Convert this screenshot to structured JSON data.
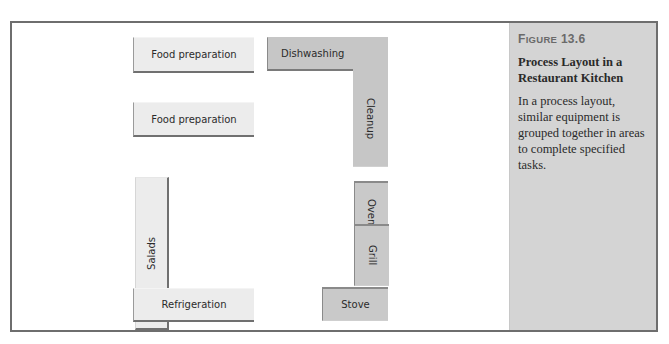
{
  "figure": {
    "label_prefix": "F",
    "label_smallcaps": "IGURE",
    "label_number": "13.6",
    "title": "Process Layout in a Restaurant Kitchen",
    "caption": "In a process layout, similar equipment is grouped together in areas to complete specified tasks."
  },
  "stations": [
    {
      "id": "food-prep-1",
      "label": "Food preparation",
      "shade": "light",
      "orientation": "horizontal"
    },
    {
      "id": "food-prep-2",
      "label": "Food preparation",
      "shade": "light",
      "orientation": "horizontal"
    },
    {
      "id": "salads",
      "label": "Salads",
      "shade": "light",
      "orientation": "vertical"
    },
    {
      "id": "refrigeration",
      "label": "Refrigeration",
      "shade": "light",
      "orientation": "horizontal"
    },
    {
      "id": "dishwashing",
      "label": "Dishwashing",
      "shade": "dark",
      "orientation": "horizontal"
    },
    {
      "id": "cleanup",
      "label": "Cleanup",
      "shade": "dark",
      "orientation": "vertical"
    },
    {
      "id": "oven",
      "label": "Oven",
      "shade": "dark",
      "orientation": "vertical"
    },
    {
      "id": "grill",
      "label": "Grill",
      "shade": "dark",
      "orientation": "vertical"
    },
    {
      "id": "stove",
      "label": "Stove",
      "shade": "dark",
      "orientation": "horizontal"
    }
  ],
  "colors": {
    "frame_border": "#6e6e6e",
    "sidebar_bg": "#d4d4d4",
    "light_station": "#ececec",
    "dark_station": "#c9c9c9",
    "figure_label": "#6a6a6a"
  }
}
